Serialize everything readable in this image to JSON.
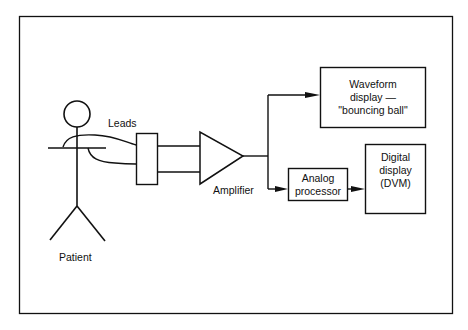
{
  "diagram": {
    "title": "",
    "nodes": {
      "patient": {
        "label": "Patient"
      },
      "leads": {
        "label": "Leads"
      },
      "amplifier": {
        "label": "Amplifier"
      },
      "waveform_display": {
        "lines": [
          "Waveform",
          "display —",
          "\"bouncing ball\""
        ]
      },
      "analog_processor": {
        "lines": [
          "Analog",
          "processor"
        ]
      },
      "digital_display": {
        "lines": [
          "Digital",
          "display",
          "(DVM)"
        ]
      }
    },
    "edges": [
      {
        "from": "patient",
        "to": "connector",
        "label": "Leads"
      },
      {
        "from": "connector",
        "to": "amplifier"
      },
      {
        "from": "amplifier",
        "to": "waveform_display",
        "arrow": true
      },
      {
        "from": "amplifier",
        "to": "analog_processor",
        "arrow": true
      },
      {
        "from": "analog_processor",
        "to": "digital_display",
        "arrow": true
      }
    ],
    "colors": {
      "stroke": "#111111",
      "background": "#ffffff"
    }
  }
}
